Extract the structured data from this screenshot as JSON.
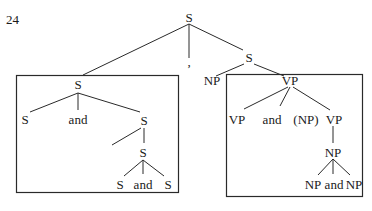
{
  "figure": {
    "number": "24"
  },
  "tree": {
    "root": {
      "label": "S"
    },
    "comma": {
      "label": ","
    },
    "left_box": {
      "top": {
        "label": "S"
      },
      "children": [
        {
          "label": "S"
        },
        {
          "label": "and"
        },
        {
          "label": "S"
        }
      ],
      "inner": {
        "label": "S"
      },
      "leaves": [
        {
          "label": "S"
        },
        {
          "label": "and"
        },
        {
          "label": "S"
        }
      ]
    },
    "right_branch": {
      "s": {
        "label": "S"
      },
      "np": {
        "label": "NP"
      },
      "right_box": {
        "top": {
          "label": "VP"
        },
        "children": [
          {
            "label": "VP"
          },
          {
            "label": "and"
          },
          {
            "label": "(NP)"
          },
          {
            "label": "VP"
          }
        ],
        "np": {
          "label": "NP"
        },
        "leaves": [
          {
            "label": "NP"
          },
          {
            "label": "and"
          },
          {
            "label": "NP"
          }
        ]
      }
    }
  }
}
